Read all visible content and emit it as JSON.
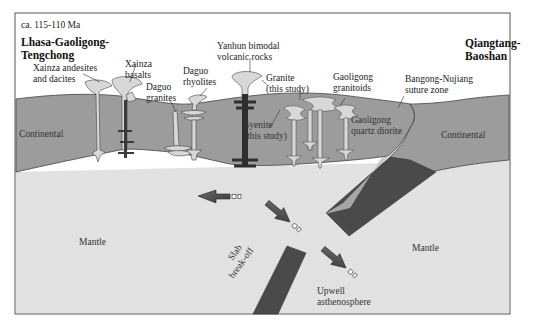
{
  "figure": {
    "age_label": "ca. 115-110 Ma",
    "colors": {
      "background": "#ffffff",
      "frame": "#555555",
      "continental_crust": "#9c9c9c",
      "mantle": "#e2e2e2",
      "slab": "#4a4a4a",
      "pluton_light": "#d8d8d8",
      "pluton_dark": "#3a3a3a",
      "arrow": "#5a5a5a"
    }
  },
  "terranes": {
    "left": {
      "line1": "Lhasa-Gaoligong-",
      "line2": "Tengchong"
    },
    "right": {
      "line1": "Qiangtang-",
      "line2": "Baoshan"
    }
  },
  "units": {
    "xainza_andesites": {
      "line1": "Xainza andesites",
      "line2": "and dacites"
    },
    "xainza_basalts": {
      "line1": "Xainza",
      "line2": "basalts"
    },
    "daguo_granites": {
      "line1": "Daguo",
      "line2": "granites"
    },
    "daguo_rhyolites": {
      "line1": "Daguo",
      "line2": "rhyolites"
    },
    "yanhun": {
      "line1": "Yanhun bimodal",
      "line2": "volcanic rocks"
    },
    "granite": {
      "line1": "Granite",
      "line2": "(this study)"
    },
    "syenite": {
      "line1": "Syenite",
      "line2": "(this study)"
    },
    "gaoligong_granitoids": {
      "line1": "Gaoligong",
      "line2": "granitoids"
    },
    "gaoligong_quartz_diorite": {
      "line1": "Gaoligong",
      "line2": "quartz diorite"
    },
    "suture": {
      "line1": "Bangong-Nujiang",
      "line2": "suture zone"
    }
  },
  "layers": {
    "continental_left": "Continental",
    "continental_right": "Continental",
    "mantle_left": "Mantle",
    "mantle_right": "Mantle"
  },
  "processes": {
    "slab_breakoff": {
      "line1": "Slab",
      "line2": "break-off"
    },
    "upwell": {
      "line1": "Upwell",
      "line2": "asthenosphere"
    }
  }
}
